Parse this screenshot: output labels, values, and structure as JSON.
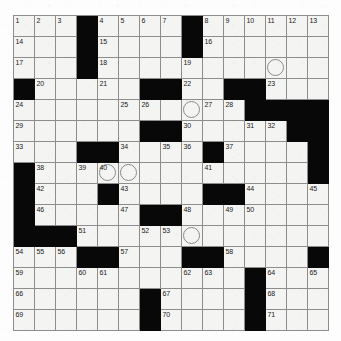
{
  "puzzle": {
    "type": "crossword-grid",
    "rows": 15,
    "columns": 15,
    "cell_size_px": 21,
    "colors": {
      "block": "#080808",
      "open_cell": "#f4f4f2",
      "grid_line": "#8d8d8d",
      "number_text": "#1b1b1b",
      "circle_outline": "#8a8a8a",
      "page_background": "#fdfdfd"
    },
    "highest_clue_number": 71,
    "block_count": 58,
    "circled_cell_count": 5,
    "blocks": [
      [
        0,
        3
      ],
      [
        0,
        8
      ],
      [
        1,
        3
      ],
      [
        1,
        8
      ],
      [
        2,
        3
      ],
      [
        3,
        0
      ],
      [
        3,
        6
      ],
      [
        3,
        7
      ],
      [
        3,
        10
      ],
      [
        3,
        11
      ],
      [
        4,
        11
      ],
      [
        4,
        12
      ],
      [
        4,
        13
      ],
      [
        4,
        14
      ],
      [
        5,
        6
      ],
      [
        5,
        7
      ],
      [
        5,
        13
      ],
      [
        5,
        14
      ],
      [
        6,
        3
      ],
      [
        6,
        4
      ],
      [
        6,
        9
      ],
      [
        6,
        14
      ],
      [
        7,
        0
      ],
      [
        7,
        14
      ],
      [
        8,
        0
      ],
      [
        8,
        4
      ],
      [
        8,
        9
      ],
      [
        8,
        10
      ],
      [
        9,
        0
      ],
      [
        9,
        6
      ],
      [
        9,
        7
      ],
      [
        10,
        0
      ],
      [
        10,
        1
      ],
      [
        10,
        2
      ],
      [
        11,
        3
      ],
      [
        11,
        4
      ],
      [
        11,
        8
      ],
      [
        11,
        9
      ],
      [
        11,
        14
      ],
      [
        12,
        11
      ],
      [
        13,
        6
      ],
      [
        13,
        11
      ],
      [
        14,
        6
      ],
      [
        14,
        11
      ]
    ],
    "numbered_cells": [
      {
        "n": 1,
        "row": 0,
        "col": 0
      },
      {
        "n": 2,
        "row": 0,
        "col": 1
      },
      {
        "n": 3,
        "row": 0,
        "col": 2
      },
      {
        "n": 4,
        "row": 0,
        "col": 4
      },
      {
        "n": 5,
        "row": 0,
        "col": 5
      },
      {
        "n": 6,
        "row": 0,
        "col": 6
      },
      {
        "n": 7,
        "row": 0,
        "col": 7
      },
      {
        "n": 8,
        "row": 0,
        "col": 9
      },
      {
        "n": 9,
        "row": 0,
        "col": 10
      },
      {
        "n": 10,
        "row": 0,
        "col": 11
      },
      {
        "n": 11,
        "row": 0,
        "col": 12
      },
      {
        "n": 12,
        "row": 0,
        "col": 13
      },
      {
        "n": 13,
        "row": 0,
        "col": 14
      },
      {
        "n": 14,
        "row": 1,
        "col": 0
      },
      {
        "n": 15,
        "row": 1,
        "col": 4
      },
      {
        "n": 16,
        "row": 1,
        "col": 9
      },
      {
        "n": 17,
        "row": 2,
        "col": 0
      },
      {
        "n": 18,
        "row": 2,
        "col": 4
      },
      {
        "n": 19,
        "row": 2,
        "col": 8
      },
      {
        "n": 20,
        "row": 3,
        "col": 1
      },
      {
        "n": 21,
        "row": 3,
        "col": 4
      },
      {
        "n": 22,
        "row": 3,
        "col": 8
      },
      {
        "n": 23,
        "row": 3,
        "col": 12
      },
      {
        "n": 24,
        "row": 4,
        "col": 0
      },
      {
        "n": 25,
        "row": 4,
        "col": 5
      },
      {
        "n": 26,
        "row": 4,
        "col": 6
      },
      {
        "n": 27,
        "row": 4,
        "col": 9
      },
      {
        "n": 28,
        "row": 4,
        "col": 10
      },
      {
        "n": 29,
        "row": 5,
        "col": 0
      },
      {
        "n": 30,
        "row": 5,
        "col": 8
      },
      {
        "n": 31,
        "row": 5,
        "col": 11
      },
      {
        "n": 32,
        "row": 5,
        "col": 12
      },
      {
        "n": 33,
        "row": 6,
        "col": 0
      },
      {
        "n": 34,
        "row": 6,
        "col": 5
      },
      {
        "n": 35,
        "row": 6,
        "col": 7
      },
      {
        "n": 36,
        "row": 6,
        "col": 8
      },
      {
        "n": 37,
        "row": 6,
        "col": 10
      },
      {
        "n": 38,
        "row": 7,
        "col": 1
      },
      {
        "n": 39,
        "row": 7,
        "col": 3
      },
      {
        "n": 40,
        "row": 7,
        "col": 4
      },
      {
        "n": 41,
        "row": 7,
        "col": 9
      },
      {
        "n": 42,
        "row": 8,
        "col": 1
      },
      {
        "n": 43,
        "row": 8,
        "col": 5
      },
      {
        "n": 44,
        "row": 8,
        "col": 11
      },
      {
        "n": 45,
        "row": 8,
        "col": 14
      },
      {
        "n": 46,
        "row": 9,
        "col": 1
      },
      {
        "n": 47,
        "row": 9,
        "col": 5
      },
      {
        "n": 48,
        "row": 9,
        "col": 8
      },
      {
        "n": 49,
        "row": 9,
        "col": 10
      },
      {
        "n": 50,
        "row": 9,
        "col": 11
      },
      {
        "n": 51,
        "row": 10,
        "col": 3
      },
      {
        "n": 52,
        "row": 10,
        "col": 6
      },
      {
        "n": 53,
        "row": 10,
        "col": 7
      },
      {
        "n": 54,
        "row": 11,
        "col": 0
      },
      {
        "n": 55,
        "row": 11,
        "col": 1
      },
      {
        "n": 56,
        "row": 11,
        "col": 2
      },
      {
        "n": 57,
        "row": 11,
        "col": 5
      },
      {
        "n": 58,
        "row": 11,
        "col": 10
      },
      {
        "n": 59,
        "row": 12,
        "col": 0
      },
      {
        "n": 60,
        "row": 12,
        "col": 3
      },
      {
        "n": 61,
        "row": 12,
        "col": 4
      },
      {
        "n": 62,
        "row": 12,
        "col": 8
      },
      {
        "n": 63,
        "row": 12,
        "col": 9
      },
      {
        "n": 64,
        "row": 12,
        "col": 12
      },
      {
        "n": 65,
        "row": 12,
        "col": 14
      },
      {
        "n": 66,
        "row": 13,
        "col": 0
      },
      {
        "n": 67,
        "row": 13,
        "col": 7
      },
      {
        "n": 68,
        "row": 13,
        "col": 12
      },
      {
        "n": 69,
        "row": 14,
        "col": 0
      },
      {
        "n": 70,
        "row": 14,
        "col": 7
      },
      {
        "n": 71,
        "row": 14,
        "col": 12
      }
    ],
    "circled_cells": [
      {
        "row": 2,
        "col": 12
      },
      {
        "row": 4,
        "col": 8
      },
      {
        "row": 7,
        "col": 4
      },
      {
        "row": 7,
        "col": 5
      },
      {
        "row": 10,
        "col": 8
      }
    ]
  }
}
